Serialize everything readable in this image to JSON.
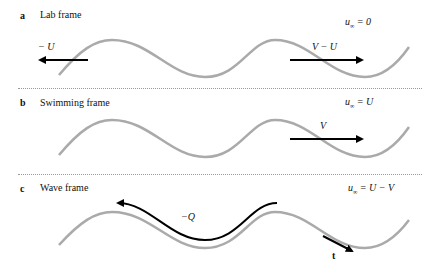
{
  "colors": {
    "wave": "#aaaaaa",
    "arrow": "#000000",
    "divider": "#999999"
  },
  "panels": [
    {
      "letter": "a",
      "title": "Lab frame",
      "eq_lhs": "u",
      "eq_sub": "∞",
      "eq_rhs": " = 0",
      "arrows": [
        {
          "label": "− U",
          "direction": "left"
        },
        {
          "label": "V − U",
          "direction": "right"
        }
      ]
    },
    {
      "letter": "b",
      "title": "Swimming frame",
      "eq_lhs": "u",
      "eq_sub": "∞",
      "eq_rhs": " = U",
      "arrows": [
        {
          "label": "V",
          "direction": "right"
        }
      ]
    },
    {
      "letter": "c",
      "title": "Wave frame",
      "eq_lhs": "u",
      "eq_sub": "∞",
      "eq_rhs": " = U − V",
      "arrows": [
        {
          "label": "−Q",
          "direction": "left-along-wave"
        },
        {
          "label": "t",
          "direction": "tangent"
        }
      ]
    }
  ]
}
